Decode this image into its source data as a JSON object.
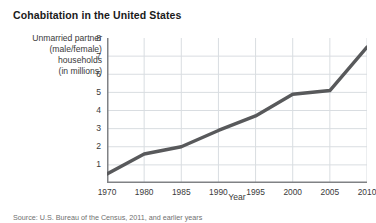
{
  "figure": {
    "title": "Cohabitation in the United States",
    "source_note": "Source: U.S. Bureau of the Census, 2011, and earlier years",
    "background_color": "#ffffff",
    "line_color": "#58595b",
    "grid_color": "#d9dde1",
    "axis_color": "#808285",
    "text_color": "#3a3a3a"
  },
  "ylabel_lines": [
    "Unmarried partner",
    "(male/female)",
    "households",
    "(in millions)"
  ],
  "chart_data": {
    "type": "line",
    "title": "Cohabitation in the United States",
    "subtitle": "",
    "xlabel": "Year",
    "ylabel": "Unmarried partner (male/female) households (in millions)",
    "categories": [
      "1970",
      "1980",
      "1985",
      "1990",
      "1995",
      "2000",
      "2005",
      "2010"
    ],
    "x": [
      1970,
      1980,
      1985,
      1990,
      1995,
      2000,
      2005,
      2010
    ],
    "values": [
      0.5,
      1.6,
      2.0,
      2.9,
      3.7,
      4.9,
      5.1,
      7.5
    ],
    "series": [
      {
        "name": "Unmarried partner households",
        "values": [
          0.5,
          1.6,
          2.0,
          2.9,
          3.7,
          4.9,
          5.1,
          7.5
        ]
      }
    ],
    "xtick_labels": [
      "1970",
      "1980",
      "1985",
      "1990",
      "1995",
      "2000",
      "2005",
      "2010"
    ],
    "ytick_labels": [
      "1",
      "2",
      "3",
      "4",
      "5",
      "6",
      "7",
      "8"
    ],
    "ytick_values": [
      1,
      2,
      3,
      4,
      5,
      6,
      7,
      8
    ],
    "ylim": [
      0,
      8
    ],
    "xlim": [
      1970,
      2010
    ],
    "grid": true,
    "grid_axis": "both",
    "legend": false,
    "legend_position": "none",
    "annotations": []
  }
}
